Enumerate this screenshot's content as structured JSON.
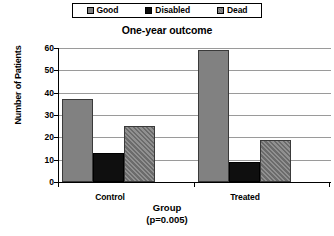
{
  "chart_data": {
    "type": "bar",
    "title": "One-year outcome",
    "xlabel": "Group",
    "xlabel_note": "(p=0.005)",
    "ylabel": "Number of Patients",
    "categories": [
      "Control",
      "Treated"
    ],
    "series": [
      {
        "name": "Good",
        "values": [
          37,
          59
        ],
        "swatch": "solid-gray",
        "color": "#818181"
      },
      {
        "name": "Disabled",
        "values": [
          13,
          9
        ],
        "swatch": "solid-black",
        "color": "#0f0f0f"
      },
      {
        "name": "Dead",
        "values": [
          25,
          19
        ],
        "swatch": "hatched-gray",
        "color": "#808080"
      }
    ],
    "ylim": [
      0,
      60
    ],
    "yticks": [
      0,
      10,
      20,
      30,
      40,
      50,
      60
    ],
    "ytick_labels": [
      "0",
      "10",
      "20",
      "30",
      "40",
      "50",
      "60"
    ],
    "grid": true,
    "legend_position": "top",
    "legend_border_color": "#000000",
    "gridline_color": "#9a9a9a",
    "axis_color": "#000000",
    "background": "#ffffff"
  },
  "legend": {
    "items": [
      {
        "label": "Good"
      },
      {
        "label": "Disabled"
      },
      {
        "label": "Dead"
      }
    ]
  }
}
